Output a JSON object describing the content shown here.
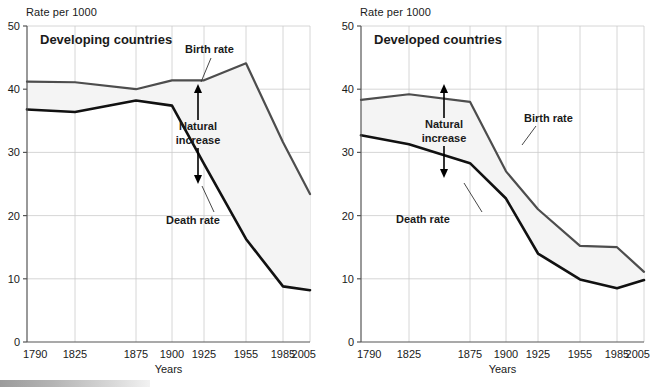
{
  "figure": {
    "background": "#ffffff",
    "axis_color": "#555555",
    "grid_color": "#cccccc",
    "birth_color": "#4d4d4d",
    "death_color": "#111111",
    "band_fill": "#f4f4f4"
  },
  "panels": [
    {
      "id": "developing",
      "title": "Developing countries",
      "y_caption": "Rate per 1000",
      "x_title": "Years",
      "annotations": {
        "birth_label": "Birth rate",
        "death_label": "Death rate",
        "natural_increase_line1": "Natural",
        "natural_increase_line2": "increase"
      },
      "chart_data": {
        "type": "line",
        "title": "Developing countries",
        "xlabel": "Years",
        "ylabel": "Rate per 1000",
        "ylim": [
          0,
          50
        ],
        "yticks": [
          0,
          10,
          20,
          30,
          40,
          50
        ],
        "grid": true,
        "legend": "inline-annotations",
        "categories": [
          "1790",
          "1825",
          "1875",
          "1900",
          "1925",
          "1955",
          "1985",
          "2005"
        ],
        "x": [
          1790,
          1825,
          1875,
          1900,
          1925,
          1955,
          1985,
          2005
        ],
        "series": [
          {
            "name": "Birth rate",
            "values": [
              41.2,
              41.1,
              40.0,
              41.4,
              41.4,
              44.1,
              31.6,
              23.4
            ]
          },
          {
            "name": "Death rate",
            "values": [
              36.8,
              36.4,
              38.2,
              37.4,
              28.2,
              16.3,
              8.8,
              8.2
            ]
          }
        ],
        "band": {
          "name": "Natural increase",
          "between": [
            "Birth rate",
            "Death rate"
          ]
        }
      }
    },
    {
      "id": "developed",
      "title": "Developed countries",
      "y_caption": "Rate per 1000",
      "x_title": "Years",
      "annotations": {
        "birth_label": "Birth rate",
        "death_label": "Death rate",
        "natural_increase_line1": "Natural",
        "natural_increase_line2": "increase"
      },
      "chart_data": {
        "type": "line",
        "title": "Developed countries",
        "xlabel": "Years",
        "ylabel": "Rate per 1000",
        "ylim": [
          0,
          50
        ],
        "yticks": [
          0,
          10,
          20,
          30,
          40,
          50
        ],
        "grid": true,
        "legend": "inline-annotations",
        "categories": [
          "1790",
          "1825",
          "1875",
          "1900",
          "1925",
          "1955",
          "1985",
          "2005"
        ],
        "x": [
          1790,
          1825,
          1875,
          1900,
          1925,
          1955,
          1985,
          2005
        ],
        "series": [
          {
            "name": "Birth rate",
            "values": [
              38.3,
              39.2,
              38.0,
              27.0,
              21.0,
              15.2,
              15.0,
              11.1
            ]
          },
          {
            "name": "Death rate",
            "values": [
              32.7,
              31.3,
              28.3,
              22.7,
              14.0,
              9.9,
              8.5,
              9.8
            ]
          }
        ],
        "band": {
          "name": "Natural increase",
          "between": [
            "Birth rate",
            "Death rate"
          ]
        }
      }
    }
  ]
}
